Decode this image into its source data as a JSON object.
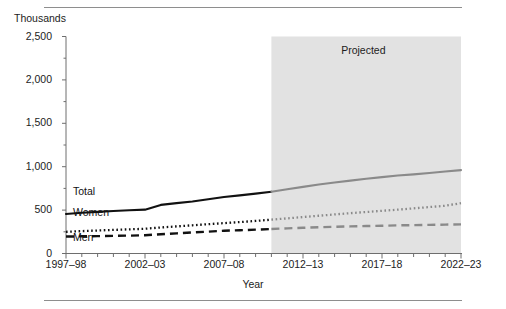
{
  "figure": {
    "unit_label": "Thousands",
    "x_axis_title": "Year",
    "projected_label": "Projected"
  },
  "chart_data": {
    "type": "line",
    "title": "",
    "subtitle": "",
    "xlabel": "Year",
    "ylabel": "Thousands",
    "ylim": [
      0,
      2500
    ],
    "grid": false,
    "legend_position": "inline-labels",
    "y_ticks": [
      0,
      500,
      1000,
      1500,
      2000,
      2500
    ],
    "y_tick_labels": [
      "0",
      "500",
      "1,000",
      "1,500",
      "2,000",
      "2,500"
    ],
    "x_tick_labels": [
      "1997–98",
      "2002–03",
      "2007–08",
      "2012–13",
      "2017–18",
      "2022–23"
    ],
    "x_tick_values": [
      1997,
      2002,
      2007,
      2012,
      2017,
      2022
    ],
    "x_minor_count": 26,
    "x_range": [
      1997,
      2022
    ],
    "projected_start_x": 2010,
    "projected_end_x": 2022,
    "annotations": [
      {
        "text": "Projected",
        "x": 2016,
        "y": 2350
      }
    ],
    "series": [
      {
        "name": "Total",
        "label": "Total",
        "style": "solid",
        "actual_color": "#111111",
        "projected_color": "#8a8a8a",
        "x": [
          1997,
          1998,
          1999,
          2000,
          2001,
          2002,
          2003,
          2004,
          2005,
          2006,
          2007,
          2008,
          2009,
          2010,
          2011,
          2012,
          2013,
          2014,
          2015,
          2016,
          2017,
          2018,
          2019,
          2020,
          2021,
          2022
        ],
        "values": [
          455,
          470,
          480,
          490,
          498,
          505,
          560,
          580,
          600,
          625,
          650,
          670,
          690,
          712,
          740,
          768,
          795,
          818,
          840,
          862,
          880,
          898,
          912,
          928,
          945,
          960
        ]
      },
      {
        "name": "Women",
        "label": "Women",
        "style": "dotted",
        "actual_color": "#111111",
        "projected_color": "#8a8a8a",
        "x": [
          1997,
          1998,
          1999,
          2000,
          2001,
          2002,
          2003,
          2004,
          2005,
          2006,
          2007,
          2008,
          2009,
          2010,
          2011,
          2012,
          2013,
          2014,
          2015,
          2016,
          2017,
          2018,
          2019,
          2020,
          2021,
          2022
        ],
        "values": [
          250,
          258,
          265,
          272,
          278,
          285,
          300,
          312,
          325,
          338,
          350,
          362,
          375,
          390,
          405,
          420,
          435,
          450,
          465,
          478,
          492,
          505,
          520,
          535,
          550,
          580
        ]
      },
      {
        "name": "Men",
        "label": "Men",
        "style": "dashed",
        "actual_color": "#111111",
        "projected_color": "#8a8a8a",
        "x": [
          1997,
          1998,
          1999,
          2000,
          2001,
          2002,
          2003,
          2004,
          2005,
          2006,
          2007,
          2008,
          2009,
          2010,
          2011,
          2012,
          2013,
          2014,
          2015,
          2016,
          2017,
          2018,
          2019,
          2020,
          2021,
          2022
        ],
        "values": [
          195,
          198,
          200,
          203,
          206,
          210,
          222,
          232,
          242,
          252,
          262,
          268,
          275,
          282,
          290,
          296,
          302,
          308,
          312,
          316,
          320,
          324,
          327,
          330,
          333,
          336
        ]
      }
    ],
    "series_inline_labels": [
      {
        "name": "Total",
        "text": "Total",
        "px": 73,
        "py": 191
      },
      {
        "name": "Women",
        "text": "Women",
        "px": 73,
        "py": 212
      },
      {
        "name": "Men",
        "text": "Men",
        "px": 73,
        "py": 237
      }
    ],
    "colors": {
      "actual": "#111111",
      "projected": "#8a8a8a",
      "shaded_band": "#e2e2e2",
      "axis": "#6e6e6e",
      "rule": "#8e8e8e",
      "text": "#1c1c1c"
    }
  }
}
